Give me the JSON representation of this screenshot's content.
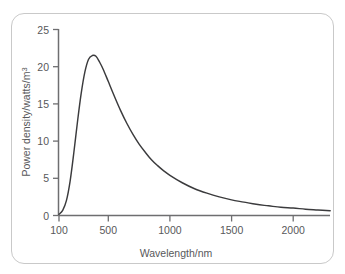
{
  "figure": {
    "border_color": "#c9c9c9",
    "background_color": "#ffffff"
  },
  "chart_data": {
    "type": "line",
    "title": "",
    "xlabel": "Wavelength/nm",
    "ylabel": "Power density/watts/m",
    "ylabel_superscript": "3",
    "xlim": [
      100,
      2300
    ],
    "ylim": [
      0,
      25
    ],
    "grid": false,
    "legend": null,
    "axis_color": "#6e6e70",
    "curve_color": "#3b3b3d",
    "xticks": [
      100,
      500,
      1000,
      1500,
      2000
    ],
    "xtick_labels": [
      "100",
      "500",
      "1000",
      "1500",
      "2000"
    ],
    "yticks": [
      0,
      5,
      10,
      15,
      20,
      25
    ],
    "ytick_labels": [
      "0",
      "5",
      "10",
      "15",
      "20",
      "25"
    ],
    "series": [
      {
        "name": "Power density spectrum",
        "x": [
          100,
          130,
          160,
          190,
          220,
          250,
          280,
          310,
          340,
          370,
          400,
          430,
          460,
          500,
          550,
          600,
          650,
          700,
          750,
          800,
          850,
          900,
          950,
          1000,
          1100,
          1200,
          1300,
          1400,
          1500,
          1600,
          1700,
          1800,
          1900,
          2000,
          2100,
          2200,
          2300
        ],
        "y": [
          0.15,
          0.7,
          2.0,
          4.6,
          8.4,
          12.6,
          16.4,
          19.3,
          21.0,
          21.5,
          21.4,
          20.6,
          19.6,
          18.0,
          16.0,
          14.1,
          12.4,
          10.9,
          9.6,
          8.5,
          7.5,
          6.7,
          6.0,
          5.4,
          4.4,
          3.6,
          3.0,
          2.5,
          2.1,
          1.8,
          1.5,
          1.3,
          1.1,
          1.0,
          0.85,
          0.75,
          0.65
        ]
      }
    ],
    "peak": {
      "x": 400,
      "y": 21.5
    }
  }
}
